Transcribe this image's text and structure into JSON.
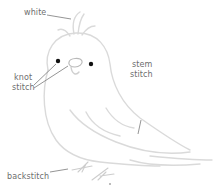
{
  "illustration": {
    "subject": "bird embroidery pattern",
    "line_color": "#d9d9d9",
    "leader_color": "#6e6e6e",
    "eye_color": "#111111"
  },
  "labels": {
    "white": "white",
    "knot_line1": "knot",
    "knot_line2": "stitch",
    "stem_line1": "stem",
    "stem_line2": "stitch",
    "backstitch": "backstitch"
  }
}
